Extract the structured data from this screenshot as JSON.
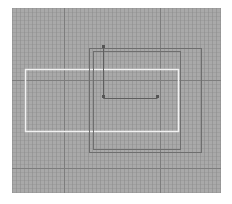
{
  "viewport": {
    "background": "#ffffff",
    "canvas": {
      "x": 12,
      "y": 8,
      "width": 209,
      "height": 185,
      "color": "#a9a9a9"
    },
    "grid": {
      "minor_spacing": 4,
      "minor_color": "#8c8c8c",
      "major_color": "#7d7d7d",
      "major_vertical_x": [
        64,
        160
      ],
      "major_horizontal_y": [
        80,
        168
      ]
    }
  },
  "shapes": {
    "white_rect": {
      "x": 25,
      "y": 69,
      "width": 153,
      "height": 62,
      "stroke": "#f2f2f2",
      "stroke_width": 1.5
    },
    "outer_rect": {
      "x": 89,
      "y": 48,
      "width": 112,
      "height": 104,
      "stroke": "#6e6e6e",
      "stroke_width": 1
    },
    "inner_rect": {
      "x": 93,
      "y": 51,
      "width": 87,
      "height": 98,
      "stroke": "#6e6e6e",
      "stroke_width": 1
    },
    "bracket": {
      "points": [
        [
          103,
          46
        ],
        [
          103,
          98
        ],
        [
          157,
          98
        ]
      ],
      "stroke": "#5e5e5e",
      "stroke_width": 1
    },
    "vertices": [
      {
        "x": 103,
        "y": 46
      },
      {
        "x": 103,
        "y": 96
      },
      {
        "x": 157,
        "y": 96
      }
    ],
    "vertex_color": "#555555"
  }
}
